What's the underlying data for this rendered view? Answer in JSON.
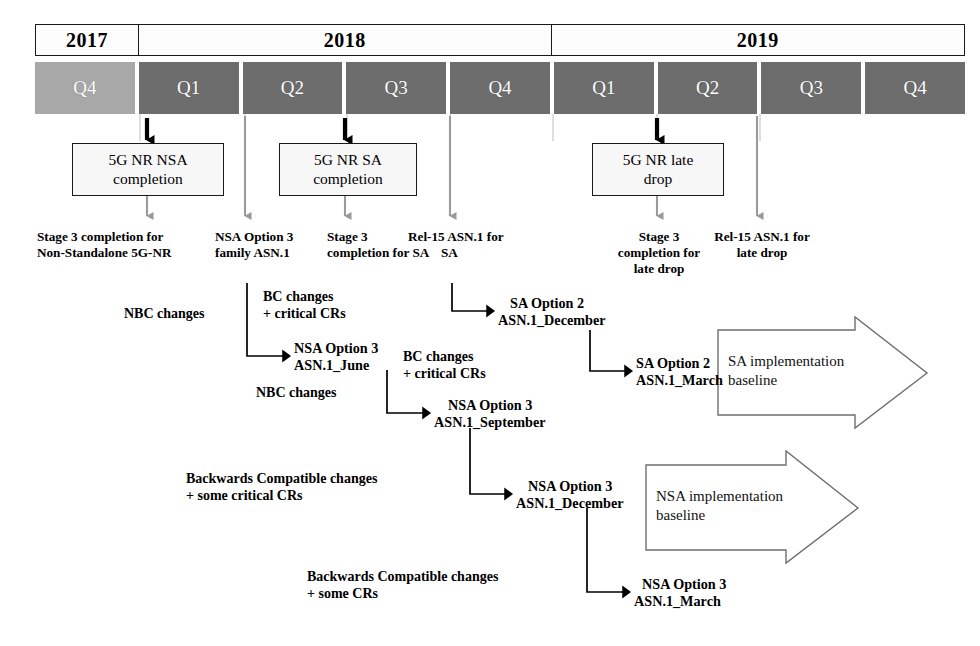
{
  "timeline": {
    "years": [
      {
        "label": "2017",
        "quarters": 1
      },
      {
        "label": "2018",
        "quarters": 4
      },
      {
        "label": "2019",
        "quarters": 4
      }
    ],
    "quarters": [
      {
        "label": "Q4",
        "year": "2017",
        "shade": "light"
      },
      {
        "label": "Q1",
        "year": "2018",
        "shade": "dark"
      },
      {
        "label": "Q2",
        "year": "2018",
        "shade": "dark"
      },
      {
        "label": "Q3",
        "year": "2018",
        "shade": "dark"
      },
      {
        "label": "Q4",
        "year": "2018",
        "shade": "dark"
      },
      {
        "label": "Q1",
        "year": "2019",
        "shade": "dark"
      },
      {
        "label": "Q2",
        "year": "2019",
        "shade": "dark"
      },
      {
        "label": "Q3",
        "year": "2019",
        "shade": "dark"
      },
      {
        "label": "Q4",
        "year": "2019",
        "shade": "dark"
      }
    ],
    "colors": {
      "quarter_light": "#a8a8a8",
      "quarter_dark": "#6d6d6d",
      "year_fill": "#fdfdfd",
      "outline": "#1a1a1a",
      "gray_arrow": "#9a9a9a",
      "black_arrow": "#000000"
    }
  },
  "milestones": [
    {
      "id": "nsa-completion",
      "line1": "5G NR NSA",
      "line2": "completion"
    },
    {
      "id": "sa-completion",
      "line1": "5G NR SA",
      "line2": "completion"
    },
    {
      "id": "late-drop",
      "line1": "5G NR late",
      "line2": "drop"
    }
  ],
  "captions": [
    {
      "id": "stage3-nsa",
      "line1": "Stage 3 completion for",
      "line2": "Non-Standalone 5G-NR",
      "line3": ""
    },
    {
      "id": "nsa-option3",
      "line1": "NSA Option 3",
      "line2": "family ASN.1",
      "line3": ""
    },
    {
      "id": "stage3-sa",
      "line1": "Stage 3",
      "line2": "completion for SA",
      "line3": ""
    },
    {
      "id": "rel15-asn1-sa",
      "line1": "Rel-15 ASN.1 for",
      "line2": "SA",
      "line3": ""
    },
    {
      "id": "stage3-late-drop",
      "line1": "Stage 3",
      "line2": "completion for",
      "line3": "late drop"
    },
    {
      "id": "rel15-late-drop",
      "line1": "Rel-15 ASN.1 for",
      "line2": "late drop",
      "line3": ""
    }
  ],
  "nodes": [
    {
      "id": "nsa-june",
      "line1": "NSA Option 3",
      "line2": "ASN.1_June"
    },
    {
      "id": "sa-december",
      "line1": "SA Option 2",
      "line2": "ASN.1_December"
    },
    {
      "id": "nsa-september",
      "line1": "NSA Option 3",
      "line2": "ASN.1_September"
    },
    {
      "id": "sa-march",
      "line1": "SA Option 2",
      "line2": "ASN.1_March"
    },
    {
      "id": "nsa-december",
      "line1": "NSA Option 3",
      "line2": "ASN.1_December"
    },
    {
      "id": "nsa-march",
      "line1": "NSA Option 3",
      "line2": "ASN.1_March"
    }
  ],
  "edge_labels": [
    {
      "id": "nbc-1",
      "line1": "NBC changes",
      "line2": ""
    },
    {
      "id": "bc-crit-1",
      "line1": "BC changes",
      "line2": "+ critical CRs"
    },
    {
      "id": "nbc-2",
      "line1": "NBC changes",
      "line2": ""
    },
    {
      "id": "bc-crit-2",
      "line1": "BC changes",
      "line2": "+ critical CRs"
    },
    {
      "id": "bwd-crit",
      "line1": "Backwards Compatible changes",
      "line2": "+ some critical CRs"
    },
    {
      "id": "bwd-some",
      "line1": "Backwards Compatible changes",
      "line2": "+ some CRs"
    }
  ],
  "block_arrows": [
    {
      "id": "sa-baseline",
      "line1": "SA implementation",
      "line2": "baseline"
    },
    {
      "id": "nsa-baseline",
      "line1": "NSA implementation",
      "line2": "baseline"
    }
  ]
}
